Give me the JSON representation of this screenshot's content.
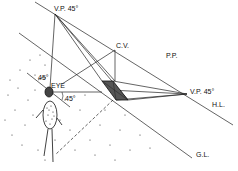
{
  "labels": {
    "vp_top": "V.P. 45°",
    "cv": "C.V.",
    "pp": "P.P.",
    "vp_right": "V.P. 45°",
    "hl": "H.L.",
    "gl": "G.L.",
    "eye": "EYE",
    "angle_upper": "45°",
    "angle_lower": "45°"
  },
  "colors": {
    "line": "#222222",
    "square_fill": "#555555",
    "ground_dots": "#333333"
  }
}
